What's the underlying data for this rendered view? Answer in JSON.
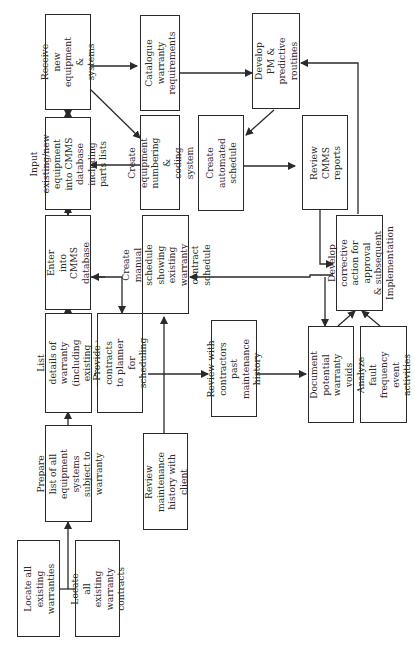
{
  "diagram": {
    "orientation": "rotated-90-ccw",
    "nodes": [
      {
        "id": "locate-warranties",
        "label": "Locate all existing\nwarranties"
      },
      {
        "id": "locate-contracts",
        "label": "Locate all existing\nwarranty contracts"
      },
      {
        "id": "prepare-list",
        "label": "Prepare list of all\nequipment systems\nsubject to warranty"
      },
      {
        "id": "list-details",
        "label": "List details of\nwarranty (including\nexisting contracts)"
      },
      {
        "id": "provide-contracts",
        "label": "Provide contracts\nto planner for\nscheduling"
      },
      {
        "id": "review-history-client",
        "label": "Review maintenance\nhistory with client"
      },
      {
        "id": "enter-cmms",
        "label": "Enter into CMMS\ndatabase"
      },
      {
        "id": "input-equipment",
        "label": "Input existing/new\nequipment into CMMS\ndatabase including\nparts lists"
      },
      {
        "id": "receive-equipment",
        "label": "Receive new\nequipment &\nsystems"
      },
      {
        "id": "catalogue-warranty",
        "label": "Catalogue warranty\nrequirements"
      },
      {
        "id": "create-numbering",
        "label": "Create equipment\nnumbering &\ncoding system"
      },
      {
        "id": "create-manual-schedule",
        "label": "Create manual\nschedule showing\nexisting warranty\ncontract schedule"
      },
      {
        "id": "review-contractors",
        "label": "Review with\ncontractors past\nmaintenance history"
      },
      {
        "id": "develop-pm",
        "label": "Develop PM &\npredictive routines"
      },
      {
        "id": "create-automated-schedule",
        "label": "Create automated\nschedule"
      },
      {
        "id": "review-cmms-reports",
        "label": "Review CMMS\nreports"
      },
      {
        "id": "develop-corrective",
        "label": "Develop corrective\naction for approval\n& subsequent\nImplementation"
      },
      {
        "id": "document-voids",
        "label": "Document potential\nwarranty voids"
      },
      {
        "id": "analyze-fault",
        "label": "Analyze fault\nfrequency event\nactivities"
      }
    ],
    "edges": [
      {
        "from": "locate-warranties",
        "to": "prepare-list"
      },
      {
        "from": "locate-contracts",
        "to": "prepare-list"
      },
      {
        "from": "prepare-list",
        "to": "list-details"
      },
      {
        "from": "list-details",
        "to": "enter-cmms"
      },
      {
        "from": "list-details",
        "to": "review-contractors"
      },
      {
        "from": "enter-cmms",
        "to": "input-equipment"
      },
      {
        "from": "input-equipment",
        "to": "receive-equipment"
      },
      {
        "from": "receive-equipment",
        "to": "catalogue-warranty"
      },
      {
        "from": "receive-equipment",
        "to": "create-numbering"
      },
      {
        "from": "create-numbering",
        "to": "input-equipment"
      },
      {
        "from": "catalogue-warranty",
        "to": "develop-pm"
      },
      {
        "from": "develop-pm",
        "to": "create-automated-schedule"
      },
      {
        "from": "create-automated-schedule",
        "to": "review-cmms-reports"
      },
      {
        "from": "review-cmms-reports",
        "to": "develop-corrective"
      },
      {
        "from": "develop-corrective",
        "to": "develop-pm"
      },
      {
        "from": "enter-cmms",
        "to": "provide-contracts"
      },
      {
        "from": "review-history-client",
        "to": "create-manual-schedule"
      },
      {
        "from": "develop-corrective",
        "to": "create-manual-schedule"
      },
      {
        "from": "review-contractors",
        "to": "document-voids"
      },
      {
        "from": "create-manual-schedule",
        "to": "document-voids"
      },
      {
        "from": "document-voids",
        "to": "develop-corrective"
      },
      {
        "from": "analyze-fault",
        "to": "develop-corrective"
      }
    ]
  }
}
